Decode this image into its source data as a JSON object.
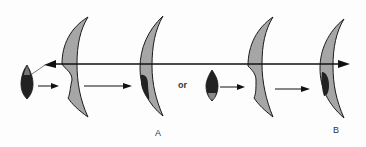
{
  "diagram": {
    "labels": {
      "or": "or",
      "a": "A",
      "b": "B"
    },
    "colors": {
      "crescent_fill": "#a6a6a6",
      "outline": "#1a1a1a",
      "dark_region": "#222222",
      "background": "#fdfdfd"
    },
    "panels": [
      {
        "id": "A",
        "description": "Dark lens-shaped object passes through a notched crescent and a dark mark appears in the lower part of the second crescent"
      },
      {
        "id": "B",
        "description": "Alternative path: dark lens-shaped object passes through a notched crescent and a dark mark appears in the lower part of the second crescent"
      }
    ]
  }
}
